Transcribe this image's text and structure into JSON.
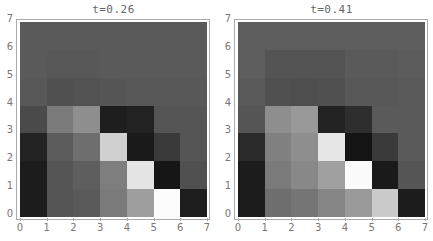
{
  "chart_data": [
    {
      "type": "heatmap",
      "title": "t=0.26",
      "xlabel": "",
      "ylabel": "",
      "x_ticks": [
        "0",
        "1",
        "2",
        "3",
        "4",
        "5",
        "6",
        "7"
      ],
      "y_ticks": [
        "0",
        "1",
        "2",
        "3",
        "4",
        "5",
        "6",
        "7"
      ],
      "xlim": [
        0,
        7
      ],
      "ylim": [
        0,
        7
      ],
      "colormap": "grayscale",
      "rows_top_to_bottom": [
        [
          "#5a5a5a",
          "#5a5a5a",
          "#5a5a5a",
          "#5a5a5a",
          "#5a5a5a",
          "#5a5a5a",
          "#5a5a5a"
        ],
        [
          "#5a5a5a",
          "#585858",
          "#585858",
          "#5a5a5a",
          "#5a5a5a",
          "#5a5a5a",
          "#5a5a5a"
        ],
        [
          "#585858",
          "#505050",
          "#525252",
          "#565656",
          "#585858",
          "#585858",
          "#585858"
        ],
        [
          "#4a4a4a",
          "#7a7a7a",
          "#8e8e8e",
          "#1e1e1e",
          "#222222",
          "#555555",
          "#555555"
        ],
        [
          "#232323",
          "#5c5c5c",
          "#6e6e6e",
          "#d0d0d0",
          "#1a1a1a",
          "#3a3a3a",
          "#555555"
        ],
        [
          "#1c1c1c",
          "#555555",
          "#5e5e5e",
          "#7e7e7e",
          "#e4e4e4",
          "#161616",
          "#505050"
        ],
        [
          "#1c1c1c",
          "#555555",
          "#5a5a5a",
          "#7a7a7a",
          "#9e9e9e",
          "#fcfcfc",
          "#1e1e1e"
        ]
      ]
    },
    {
      "type": "heatmap",
      "title": "t=0.41",
      "xlabel": "",
      "ylabel": "",
      "x_ticks": [
        "0",
        "1",
        "2",
        "3",
        "4",
        "5",
        "6",
        "7"
      ],
      "y_ticks": [
        "0",
        "1",
        "2",
        "3",
        "4",
        "5",
        "6",
        "7"
      ],
      "xlim": [
        0,
        7
      ],
      "ylim": [
        0,
        7
      ],
      "colormap": "grayscale",
      "rows_top_to_bottom": [
        [
          "#5e5e5e",
          "#5e5e5e",
          "#5e5e5e",
          "#5e5e5e",
          "#5e5e5e",
          "#5e5e5e",
          "#5e5e5e"
        ],
        [
          "#5e5e5e",
          "#545454",
          "#545454",
          "#545454",
          "#5a5a5a",
          "#5a5a5a",
          "#5c5c5c"
        ],
        [
          "#5a5a5a",
          "#505050",
          "#4e4e4e",
          "#505050",
          "#585858",
          "#585858",
          "#5a5a5a"
        ],
        [
          "#555555",
          "#8e8e8e",
          "#999999",
          "#222222",
          "#2e2e2e",
          "#5a5a5a",
          "#5a5a5a"
        ],
        [
          "#2a2a2a",
          "#808080",
          "#8e8e8e",
          "#e6e6e6",
          "#141414",
          "#3a3a3a",
          "#5a5a5a"
        ],
        [
          "#1c1c1c",
          "#7a7a7a",
          "#888888",
          "#a0a0a0",
          "#fafafa",
          "#1a1a1a",
          "#555555"
        ],
        [
          "#1c1c1c",
          "#6e6e6e",
          "#757575",
          "#858585",
          "#9a9a9a",
          "#cacaca",
          "#1c1c1c"
        ]
      ]
    }
  ],
  "panels": [
    {
      "title": "t=0.26"
    },
    {
      "title": "t=0.41"
    }
  ],
  "ticks": [
    "0",
    "1",
    "2",
    "3",
    "4",
    "5",
    "6",
    "7"
  ]
}
